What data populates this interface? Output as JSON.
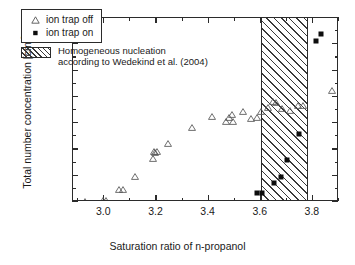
{
  "chart_data": {
    "type": "scatter",
    "title": "",
    "xlabel": "Saturation ratio of n-propanol",
    "ylabel": "Total number concentration [cm-3]",
    "ylabel_main": "Total number concentration [cm",
    "ylabel_sup": "-3",
    "ylabel_tail": "]",
    "xlim": [
      2.88,
      3.9
    ],
    "ylim": [
      0,
      35000
    ],
    "grid": false,
    "legend_position": "top-left inside",
    "xticks": [
      3.0,
      3.2,
      3.4,
      3.6,
      3.8
    ],
    "xtick_labels": [
      "3.0",
      "3.2",
      "3.4",
      "3.6",
      "3.8"
    ],
    "xminor_ticks": [
      2.9,
      3.1,
      3.3,
      3.5,
      3.7,
      3.9
    ],
    "yticks": [
      0,
      5000,
      10000,
      15000,
      20000,
      25000,
      30000,
      35000
    ],
    "ytick_labels": [
      "0",
      "5000",
      "10000",
      "15000",
      "20000",
      "25000",
      "30000",
      "35000"
    ],
    "yminor_ticks": [
      2500,
      7500,
      12500,
      17500,
      22500,
      27500,
      32500
    ],
    "shaded_band": {
      "label": "Homogeneous nucleation according to Wedekind et al. (2004)",
      "x_start": 3.6,
      "x_end": 3.783,
      "style": "diagonal-hatch"
    },
    "series": [
      {
        "name": "ion trap off",
        "marker": "open-triangle",
        "color": "#555555",
        "points": [
          [
            2.925,
            150
          ],
          [
            2.995,
            230
          ],
          [
            3.005,
            260
          ],
          [
            3.058,
            2400
          ],
          [
            3.072,
            2470
          ],
          [
            3.118,
            4800
          ],
          [
            3.185,
            8300
          ],
          [
            3.192,
            9700
          ],
          [
            3.196,
            9450
          ],
          [
            3.202,
            9550
          ],
          [
            3.243,
            11100
          ],
          [
            3.338,
            14200
          ],
          [
            3.412,
            16200
          ],
          [
            3.468,
            15400
          ],
          [
            3.478,
            16000
          ],
          [
            3.488,
            16600
          ],
          [
            3.492,
            15350
          ],
          [
            3.531,
            17300
          ],
          [
            3.562,
            15950
          ],
          [
            3.585,
            16000
          ],
          [
            3.6,
            17200
          ],
          [
            3.628,
            17900
          ],
          [
            3.648,
            19100
          ],
          [
            3.658,
            18900
          ],
          [
            3.682,
            17800
          ],
          [
            3.712,
            17500
          ],
          [
            3.742,
            18300
          ],
          [
            3.762,
            18300
          ],
          [
            3.875,
            21300
          ]
        ]
      },
      {
        "name": "ion trap on",
        "marker": "filled-square",
        "color": "#0d0d0d",
        "points": [
          [
            3.586,
            1700
          ],
          [
            3.604,
            1800
          ],
          [
            3.651,
            3700
          ],
          [
            3.678,
            4800
          ],
          [
            3.7,
            8000
          ],
          [
            3.748,
            13000
          ],
          [
            3.81,
            30700
          ],
          [
            3.83,
            31900
          ]
        ]
      }
    ]
  },
  "legend": {
    "entries": [
      {
        "label": "ion trap off",
        "marker": "open-triangle"
      },
      {
        "label": "ion trap on",
        "marker": "filled-square"
      }
    ],
    "band_line1": "Homogeneous nucleation",
    "band_line2": "according to Wedekind et al. (2004)"
  }
}
